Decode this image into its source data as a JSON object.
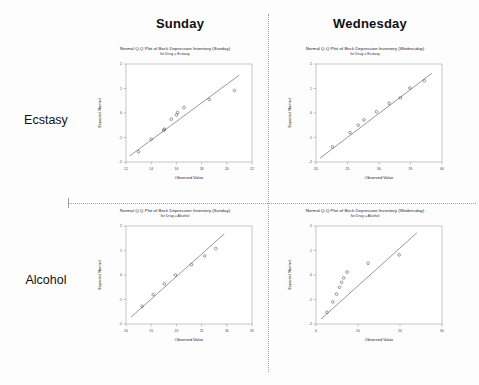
{
  "page": {
    "background": "#fdfdfd",
    "width": 479,
    "height": 385
  },
  "columns": [
    {
      "id": "sunday",
      "label": "Sunday"
    },
    {
      "id": "wednesday",
      "label": "Wednesday"
    }
  ],
  "rows": [
    {
      "id": "ecstasy",
      "label": "Ecstasy"
    },
    {
      "id": "alcohol",
      "label": "Alcohol"
    }
  ],
  "chart_data": [
    {
      "id": "sunday-ecstasy",
      "type": "scatter",
      "title": "Normal Q-Q Plot of Beck Depression Inventory (Sunday)",
      "subtitle": "for Drug = Ecstasy",
      "xlabel": "Observed Value",
      "ylabel": "Expected Normal",
      "xlim": [
        12,
        22
      ],
      "ylim": [
        -2,
        2
      ],
      "xticks": [
        12,
        14,
        16,
        18,
        20,
        22
      ],
      "yticks": [
        -2,
        -1,
        0,
        1,
        2
      ],
      "grid": false,
      "legend": "none",
      "reference_line": {
        "x": [
          12.3,
          21.0
        ],
        "y": [
          -1.75,
          1.55
        ]
      },
      "points": [
        {
          "x": 13.0,
          "y": -1.58
        },
        {
          "x": 14.0,
          "y": -1.07
        },
        {
          "x": 15.0,
          "y": -0.7
        },
        {
          "x": 15.05,
          "y": -0.66
        },
        {
          "x": 15.6,
          "y": -0.25
        },
        {
          "x": 16.0,
          "y": -0.08
        },
        {
          "x": 16.1,
          "y": 0.02
        },
        {
          "x": 16.6,
          "y": 0.22
        },
        {
          "x": 18.6,
          "y": 0.55
        },
        {
          "x": 20.6,
          "y": 0.92
        }
      ]
    },
    {
      "id": "wednesday-ecstasy",
      "type": "scatter",
      "title": "Normal Q-Q Plot of Beck Depression Inventory (Wednesday)",
      "subtitle": "for Drug = Ecstasy",
      "xlabel": "Observed Value",
      "ylabel": "Expected Normal",
      "xlim": [
        20,
        40
      ],
      "ylim": [
        -2,
        2
      ],
      "xticks": [
        20,
        25,
        30,
        35,
        40
      ],
      "yticks": [
        -2,
        -1,
        0,
        1,
        2
      ],
      "grid": false,
      "legend": "none",
      "reference_line": {
        "x": [
          20.6,
          38.4
        ],
        "y": [
          -1.85,
          1.62
        ]
      },
      "points": [
        {
          "x": 22.6,
          "y": -1.38
        },
        {
          "x": 25.4,
          "y": -0.8
        },
        {
          "x": 26.7,
          "y": -0.5
        },
        {
          "x": 27.6,
          "y": -0.28
        },
        {
          "x": 29.6,
          "y": 0.05
        },
        {
          "x": 31.6,
          "y": 0.4
        },
        {
          "x": 33.4,
          "y": 0.62
        },
        {
          "x": 34.9,
          "y": 1.02
        },
        {
          "x": 37.2,
          "y": 1.32
        }
      ]
    },
    {
      "id": "sunday-alcohol",
      "type": "scatter",
      "title": "Normal Q-Q Plot of Beck Depression Inventory (Sunday)",
      "subtitle": "for Drug = Alcohol",
      "xlabel": "Observed Value",
      "ylabel": "Expected Normal",
      "xlim": [
        10,
        35
      ],
      "ylim": [
        -2,
        2
      ],
      "xticks": [
        10,
        15,
        20,
        25,
        30,
        35
      ],
      "yticks": [
        -2,
        -1,
        0,
        1,
        2
      ],
      "grid": false,
      "legend": "none",
      "reference_line": {
        "x": [
          11.0,
          29.5
        ],
        "y": [
          -1.72,
          1.68
        ]
      },
      "points": [
        {
          "x": 13.2,
          "y": -1.28
        },
        {
          "x": 15.4,
          "y": -0.8
        },
        {
          "x": 17.6,
          "y": -0.36
        },
        {
          "x": 19.8,
          "y": 0.0
        },
        {
          "x": 23.0,
          "y": 0.42
        },
        {
          "x": 25.6,
          "y": 0.78
        },
        {
          "x": 27.8,
          "y": 1.08
        }
      ]
    },
    {
      "id": "wednesday-alcohol",
      "type": "scatter",
      "title": "Normal Q-Q Plot of Beck Depression Inventory (Wednesday)",
      "subtitle": "for Drug = Alcohol",
      "xlabel": "Observed Value",
      "ylabel": "Expected Normal",
      "xlim": [
        0,
        30
      ],
      "ylim": [
        -2,
        2
      ],
      "xticks": [
        0,
        10,
        20,
        30
      ],
      "yticks": [
        -2,
        -1,
        0,
        1,
        2
      ],
      "grid": false,
      "legend": "none",
      "reference_line": {
        "x": [
          1.2,
          24.0
        ],
        "y": [
          -1.8,
          1.72
        ]
      },
      "points": [
        {
          "x": 2.6,
          "y": -1.52
        },
        {
          "x": 4.0,
          "y": -1.1
        },
        {
          "x": 4.9,
          "y": -0.78
        },
        {
          "x": 5.6,
          "y": -0.5
        },
        {
          "x": 6.1,
          "y": -0.3
        },
        {
          "x": 6.6,
          "y": -0.12
        },
        {
          "x": 7.4,
          "y": 0.12
        },
        {
          "x": 12.4,
          "y": 0.48
        },
        {
          "x": 19.8,
          "y": 0.82
        }
      ]
    }
  ]
}
